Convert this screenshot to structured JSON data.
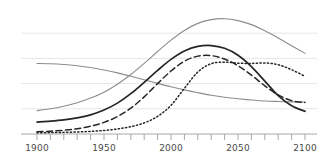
{
  "chart_data": {
    "type": "line",
    "title": "",
    "subtitle": "",
    "xlabel": "",
    "ylabel": "",
    "xlim": [
      1900,
      2100
    ],
    "ylim": [
      0,
      10
    ],
    "grid": true,
    "grid_axis": "y",
    "legend": "none",
    "xticks": [
      1900,
      1910,
      1920,
      1930,
      1940,
      1950,
      1960,
      1970,
      1980,
      1990,
      2000,
      2010,
      2020,
      2030,
      2040,
      2050,
      2060,
      2070,
      2080,
      2090,
      2100
    ],
    "xtick_labels": [
      "1900",
      "",
      "",
      "",
      "",
      "1950",
      "",
      "",
      "",
      "",
      "2000",
      "",
      "",
      "",
      "",
      "2050",
      "",
      "",
      "",
      "",
      "2100"
    ],
    "xtick_labels_shown": [
      "1900",
      "1950",
      "2000",
      "2050",
      "2100"
    ],
    "yticks": [
      2.0,
      4.0,
      6.0,
      8.0
    ],
    "ytick_labels": [
      "",
      "",
      "",
      ""
    ],
    "x": [
      1900,
      1910,
      1920,
      1930,
      1940,
      1950,
      1960,
      1970,
      1980,
      1990,
      2000,
      2010,
      2020,
      2030,
      2040,
      2050,
      2060,
      2070,
      2080,
      2090,
      2100
    ],
    "series": [
      {
        "name": "series-a-solid-thick-black",
        "style": "solid",
        "color": "#262626",
        "width": 1.7,
        "values": [
          0.95,
          1.02,
          1.12,
          1.28,
          1.52,
          1.9,
          2.45,
          3.2,
          4.1,
          5.05,
          5.92,
          6.58,
          6.95,
          7.02,
          6.8,
          6.25,
          5.35,
          4.2,
          3.05,
          2.25,
          1.8
        ]
      },
      {
        "name": "series-b-dashed-black",
        "style": "dashed",
        "color": "#262626",
        "width": 1.5,
        "values": [
          0.18,
          0.22,
          0.3,
          0.42,
          0.62,
          0.92,
          1.38,
          2.05,
          2.95,
          4.0,
          5.0,
          5.78,
          6.18,
          6.22,
          5.95,
          5.42,
          4.68,
          3.82,
          3.1,
          2.65,
          2.5
        ]
      },
      {
        "name": "series-c-dotted-black",
        "style": "dotted",
        "color": "#262626",
        "width": 1.5,
        "values": [
          0.1,
          0.11,
          0.13,
          0.16,
          0.21,
          0.28,
          0.4,
          0.58,
          0.88,
          1.4,
          2.28,
          3.62,
          4.92,
          5.58,
          5.7,
          5.62,
          5.6,
          5.64,
          5.5,
          5.1,
          4.58
        ]
      },
      {
        "name": "series-d-gray-rising-peak",
        "style": "solid",
        "color": "#8c8c8c",
        "width": 1.1,
        "values": [
          1.85,
          2.0,
          2.2,
          2.48,
          2.85,
          3.32,
          3.95,
          4.72,
          5.6,
          6.55,
          7.45,
          8.22,
          8.78,
          9.08,
          9.15,
          9.0,
          8.68,
          8.2,
          7.62,
          7.0,
          6.4
        ]
      },
      {
        "name": "series-e-gray-declining",
        "style": "solid",
        "color": "#8c8c8c",
        "width": 1.1,
        "values": [
          5.6,
          5.58,
          5.52,
          5.42,
          5.28,
          5.08,
          4.85,
          4.58,
          4.3,
          4.02,
          3.75,
          3.5,
          3.28,
          3.08,
          2.92,
          2.8,
          2.7,
          2.62,
          2.58,
          2.55,
          2.54
        ]
      }
    ],
    "axis_line_color": "#a8a8a8",
    "grid_color": "#e6e6e6",
    "tick_color": "#a8a8a8",
    "label_color": "#4a4a4a",
    "background": "#ffffff"
  }
}
